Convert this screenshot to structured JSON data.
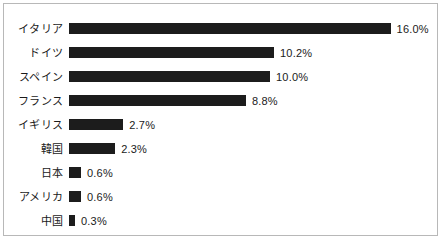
{
  "chart_data": {
    "type": "bar",
    "orientation": "horizontal",
    "title": "",
    "subtitle": "",
    "xlabel": "",
    "ylabel": "",
    "grid": false,
    "legend": null,
    "xlim": [
      0,
      16.0
    ],
    "value_suffix": "%",
    "categories": [
      "イタリア",
      "ドイツ",
      "スペイン",
      "フランス",
      "イギリス",
      "韓国",
      "日本",
      "アメリカ",
      "中国"
    ],
    "values": [
      16.0,
      10.2,
      10.0,
      8.8,
      2.7,
      2.3,
      0.6,
      0.6,
      0.3
    ],
    "value_labels": [
      "16.0%",
      "10.2%",
      "10.0%",
      "8.8%",
      "2.7%",
      "2.3%",
      "0.6%",
      "0.6%",
      "0.3%"
    ],
    "bars": [
      {
        "label": "イタリア",
        "value": 16.0,
        "value_label": "16.0%"
      },
      {
        "label": "ドイツ",
        "value": 10.2,
        "value_label": "10.2%"
      },
      {
        "label": "スペイン",
        "value": 10.0,
        "value_label": "10.0%"
      },
      {
        "label": "フランス",
        "value": 8.8,
        "value_label": "8.8%"
      },
      {
        "label": "イギリス",
        "value": 2.7,
        "value_label": "2.7%"
      },
      {
        "label": "韓国",
        "value": 2.3,
        "value_label": "2.3%"
      },
      {
        "label": "日本",
        "value": 0.6,
        "value_label": "0.6%"
      },
      {
        "label": "アメリカ",
        "value": 0.6,
        "value_label": "0.6%"
      },
      {
        "label": "中国",
        "value": 0.3,
        "value_label": "0.3%"
      }
    ]
  },
  "style": {
    "bar_color": "#1c1c1c",
    "text_color": "#1a1a1a",
    "border_color": "#b8b8b8",
    "background_color": "#ffffff"
  },
  "layout": {
    "px_per_percent": 20.1,
    "bar_height_px": 11,
    "row_pitch_px": 24,
    "first_row_top_px": 13,
    "bar_origin_x_px": 65
  }
}
